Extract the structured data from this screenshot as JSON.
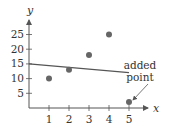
{
  "chart_data": {
    "type": "scatter",
    "title": "",
    "xlabel": "x",
    "ylabel": "y",
    "xlim": [
      0,
      5.5
    ],
    "ylim": [
      0,
      28
    ],
    "grid": false,
    "x_ticks": [
      1,
      2,
      3,
      4,
      5
    ],
    "y_ticks": [
      5,
      10,
      15,
      20,
      25
    ],
    "series": [
      {
        "name": "data points",
        "points": [
          {
            "x": 1,
            "y": 10
          },
          {
            "x": 2,
            "y": 13
          },
          {
            "x": 3,
            "y": 18
          },
          {
            "x": 4,
            "y": 25
          },
          {
            "x": 5,
            "y": 2
          }
        ]
      }
    ],
    "regression_line": {
      "x0": 0,
      "y0": 15,
      "x1": 5,
      "y1": 12
    },
    "annotations": [
      {
        "text_lines": [
          "added",
          "point"
        ],
        "target": {
          "x": 5,
          "y": 2
        }
      }
    ],
    "colors": {
      "axis": "#555555",
      "point": "#666666",
      "line": "#555555",
      "text": "#333333"
    }
  },
  "labels": {
    "x_axis": "x",
    "y_axis": "y",
    "annotation_line1": "added",
    "annotation_line2": "point",
    "x_tick_labels": [
      "1",
      "2",
      "3",
      "4",
      "5"
    ],
    "y_tick_labels": [
      "5",
      "10",
      "15",
      "20",
      "25"
    ]
  }
}
